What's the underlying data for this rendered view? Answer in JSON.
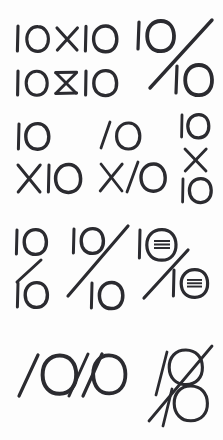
{
  "page": {
    "title": "Handwritten 10x10 and 10/10 lockup sketches",
    "medium": "pen on paper scan",
    "background_color": "#fdfdfd",
    "ink_color": "#2b2b30",
    "row_count": 4,
    "sketch_count": 11
  },
  "sketches": [
    {
      "id": "row1-10x10-plain",
      "row": 1,
      "text": "10X10",
      "layout": "inline",
      "notes": "digits 10, multiplication X, digits 10 on a single baseline"
    },
    {
      "id": "row1-10x10-bowtie",
      "row": 1,
      "text": "10X10",
      "layout": "inline",
      "notes": "X drawn as a bowtie with horizontal bars top and bottom"
    },
    {
      "id": "row1-percent-1010",
      "row": 1,
      "text": "10/10",
      "layout": "percent",
      "notes": "large percent-sign composition, 10 upper left, long diagonal slash, 10 lower right"
    },
    {
      "id": "row2-stacked-10-x10",
      "row": 2,
      "text": "10 X10",
      "layout": "stacked-two-line",
      "lines": [
        "10",
        "X10"
      ],
      "notes": "10 on top line, X10 on bottom line"
    },
    {
      "id": "row2-stacked-slash-ones",
      "row": 2,
      "text": "/0 X/0",
      "layout": "stacked-two-line",
      "lines": [
        "/0",
        "X/0"
      ],
      "notes": "the ones are drawn as slanted strokes resembling slashes"
    },
    {
      "id": "row2-stacked-10-x-10",
      "row": 2,
      "text": "10 X 10",
      "layout": "stacked-three-line",
      "lines": [
        "10",
        "X",
        "10"
      ],
      "notes": "three lines stacked vertically, centered"
    },
    {
      "id": "row3-fraction-short-slash",
      "row": 3,
      "text": "10/10",
      "layout": "fraction",
      "lines": [
        "10",
        "10"
      ],
      "notes": "stacked fraction with a short slash between the numerals"
    },
    {
      "id": "row3-fraction-long-slash",
      "row": 3,
      "text": "10/10",
      "layout": "fraction",
      "lines": [
        "10",
        "10"
      ],
      "notes": "stacked fraction cut by a long diagonal slash extending past both numerals"
    },
    {
      "id": "row3-percent-marked-zeros",
      "row": 3,
      "text": "10/10",
      "layout": "percent",
      "notes": "percent composition where both zeros contain a small horizontal scribble mark inside"
    },
    {
      "id": "row4-inline-1010",
      "row": 4,
      "text": "10/10",
      "layout": "inline",
      "notes": "single baseline with slanted ones and a slash separator"
    },
    {
      "id": "row4-compact-stacked",
      "row": 4,
      "text": "10/10",
      "layout": "compact-overlap",
      "notes": "tight vertical lockup where the two zeros touch, crossed by a long diagonal slash"
    }
  ]
}
